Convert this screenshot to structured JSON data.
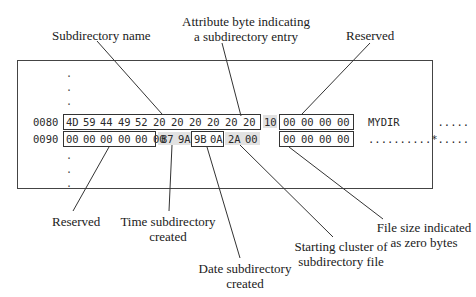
{
  "diagram": {
    "labels_top": {
      "subdirectory_name": "Subdirectory name",
      "attribute_line1": "Attribute byte indicating",
      "attribute_line2": "a subdirectory entry",
      "reserved_top": "Reserved"
    },
    "labels_bottom": {
      "reserved_bottom": "Reserved",
      "time_line1": "Time subdirectory",
      "time_line2": "created",
      "date_line1": "Date subdirectory",
      "date_line2": "created",
      "cluster_line1": "Starting cluster of",
      "cluster_line2": "subdirectory file",
      "filesize_line1": "File size indicated",
      "filesize_line2": "as zero bytes"
    },
    "dump": {
      "rows": [
        {
          "offset": "0080",
          "bytes": [
            "4D",
            "59",
            "44",
            "49",
            "52",
            "20",
            "20",
            "20",
            "20",
            "20",
            "20",
            "10",
            "00",
            "00",
            "00",
            "00"
          ],
          "ascii": "MYDIR      ....."
        },
        {
          "offset": "0090",
          "bytes": [
            "00",
            "00",
            "00",
            "00",
            "00",
            "00",
            "87",
            "9A",
            "9B",
            "0A",
            "2A",
            "00",
            "00",
            "00",
            "00",
            "00"
          ],
          "ascii": "..........*....."
        }
      ],
      "ellipsis_dot": "."
    },
    "colors": {
      "line": "#333333",
      "shade": "#e2e2e2",
      "text": "#1a1a1a"
    }
  }
}
